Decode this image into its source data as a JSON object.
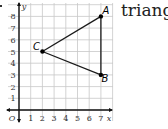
{
  "caption": "triangle",
  "chart_data": {
    "type": "scatter",
    "title": "triangle",
    "xlabel": "x",
    "ylabel": "y",
    "xlim": [
      0,
      7
    ],
    "ylim": [
      0,
      8
    ],
    "grid": true,
    "x_ticks": [
      "1",
      "2",
      "3",
      "4",
      "5",
      "6",
      "7"
    ],
    "y_ticks": [
      "1",
      "2",
      "3",
      "4",
      "5",
      "6",
      "7",
      "8"
    ],
    "origin_label": "O",
    "points": [
      {
        "name": "A",
        "x": 7,
        "y": 8
      },
      {
        "name": "B",
        "x": 7,
        "y": 3
      },
      {
        "name": "C",
        "x": 2,
        "y": 5
      }
    ],
    "segments": [
      [
        "A",
        "B"
      ],
      [
        "B",
        "C"
      ],
      [
        "C",
        "A"
      ]
    ]
  }
}
